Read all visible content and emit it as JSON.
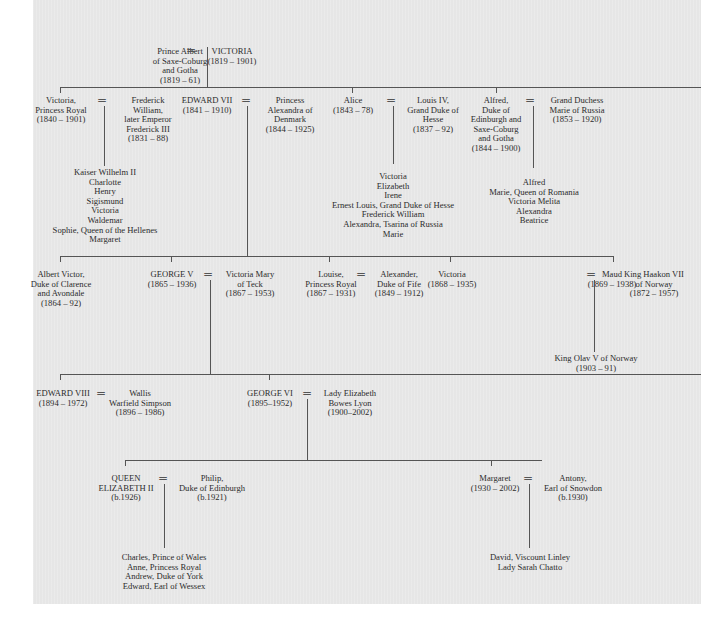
{
  "diagram": {
    "type": "family-tree",
    "marriage_symbol": "=",
    "line_color": "#555555",
    "background_color": "#e6e6e6",
    "generation1": {
      "albert": "Prince Albert\nof Saxe-Coburg\nand Gotha\n(1819 – 61)",
      "victoria": "VICTORIA\n(1819 – 1901)"
    },
    "generation2": {
      "victoria_princess_royal": "Victoria,\nPrincess Royal\n(1840 – 1901)",
      "frederick": "Frederick\nWilliam,\nlater Emperor\nFrederick III\n(1831 – 88)",
      "frederick_children": "Kaiser Wilhelm II\nCharlotte\nHenry\nSigismund\nVictoria\nWaldemar\nSophie, Queen of the Hellenes\nMargaret",
      "edward_vii": "EDWARD VII\n(1841 – 1910)",
      "alexandra": "Princess\nAlexandra of\nDenmark\n(1844 – 1925)",
      "alice": "Alice\n(1843 – 78)",
      "louis_iv": "Louis IV,\nGrand Duke of\nHesse\n(1837 – 92)",
      "alice_children": "Victoria\nElizabeth\nIrene\nErnest Louis, Grand Duke of Hesse\nFrederick William\nAlexandra, Tsarina of Russia\nMarie",
      "alfred": "Alfred,\nDuke of\nEdinburgh and\nSaxe-Coburg\nand Gotha\n(1844 – 1900)",
      "marie_of_russia": "Grand Duchess\nMarie of Russia\n(1853 – 1920)",
      "alfred_children": "Alfred\nMarie, Queen of Romania\nVictoria Melita\nAlexandra\nBeatrice"
    },
    "generation3": {
      "albert_victor": "Albert Victor,\nDuke of Clarence\nand Avondale\n(1864 – 92)",
      "george_v": "GEORGE V\n(1865 – 1936)",
      "mary_of_teck": "Victoria Mary\nof Teck\n(1867 – 1953)",
      "louise": "Louise,\nPrincess Royal\n(1867 – 1931)",
      "alexander_fife": "Alexander,\nDuke of Fife\n(1849 – 1912)",
      "victoria": "Victoria\n(1868 – 1935)",
      "maud": "Maud\n(1869 – 1938)",
      "haakon_vii": "King Haakon VII\nof Norway\n(1872 – 1957)",
      "olav_v": "King Olav V of Norway\n(1903 – 91)"
    },
    "generation4": {
      "edward_viii": "EDWARD VIII\n(1894 – 1972)",
      "wallis": "Wallis\nWarfield Simpson\n(1896 – 1986)",
      "george_vi": "GEORGE VI\n(1895–1952)",
      "elizabeth_bowes_lyon": "Lady Elizabeth\nBowes Lyon\n(1900–2002)"
    },
    "generation5": {
      "elizabeth_ii": "QUEEN\nELIZABETH II\n(b.1926)",
      "philip": "Philip,\nDuke of Edinburgh\n(b.1921)",
      "elizabeth_children": "Charles, Prince of Wales\nAnne, Princess Royal\nAndrew, Duke of York\nEdward, Earl of Wessex",
      "margaret": "Margaret\n(1930 – 2002)",
      "antony": "Antony,\nEarl of Snowdon\n(b.1930)",
      "margaret_children": "David, Viscount Linley\nLady Sarah Chatto"
    }
  }
}
